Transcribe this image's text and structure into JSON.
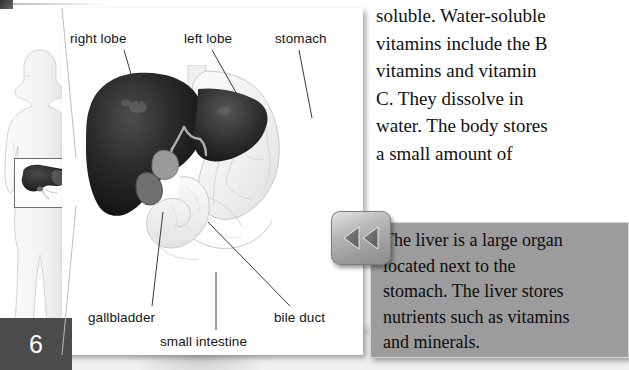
{
  "page": {
    "number": "6"
  },
  "diagram": {
    "labels": [
      {
        "id": "right-lobe",
        "text": "right lobe"
      },
      {
        "id": "left-lobe",
        "text": "left lobe"
      },
      {
        "id": "stomach",
        "text": "stomach"
      },
      {
        "id": "gallbladder",
        "text": "gallbladder"
      },
      {
        "id": "small-intestine",
        "text": "small intestine"
      },
      {
        "id": "bile-duct",
        "text": "bile duct"
      }
    ],
    "body_figure_alt": "human-body-silhouette",
    "inset_alt": "liver-location-inset"
  },
  "article": {
    "lines": [
      "soluble. Water-soluble",
      "vitamins include the B",
      "vitamins and vitamin",
      "C. They dissolve in",
      "water. The body stores",
      "a small amount of"
    ]
  },
  "callout": {
    "lines": [
      "The liver is a large organ",
      "located next to the",
      "stomach. The liver stores",
      "nutrients such as vitamins",
      "and minerals."
    ],
    "background_color": "#9c9c9c"
  },
  "controls": {
    "rewind": {
      "label": "rewind",
      "icon": "double-chevron-left-icon"
    }
  },
  "colors": {
    "page_block": "#4b4b4b",
    "panel": "#ffffff",
    "text": "#111111"
  }
}
